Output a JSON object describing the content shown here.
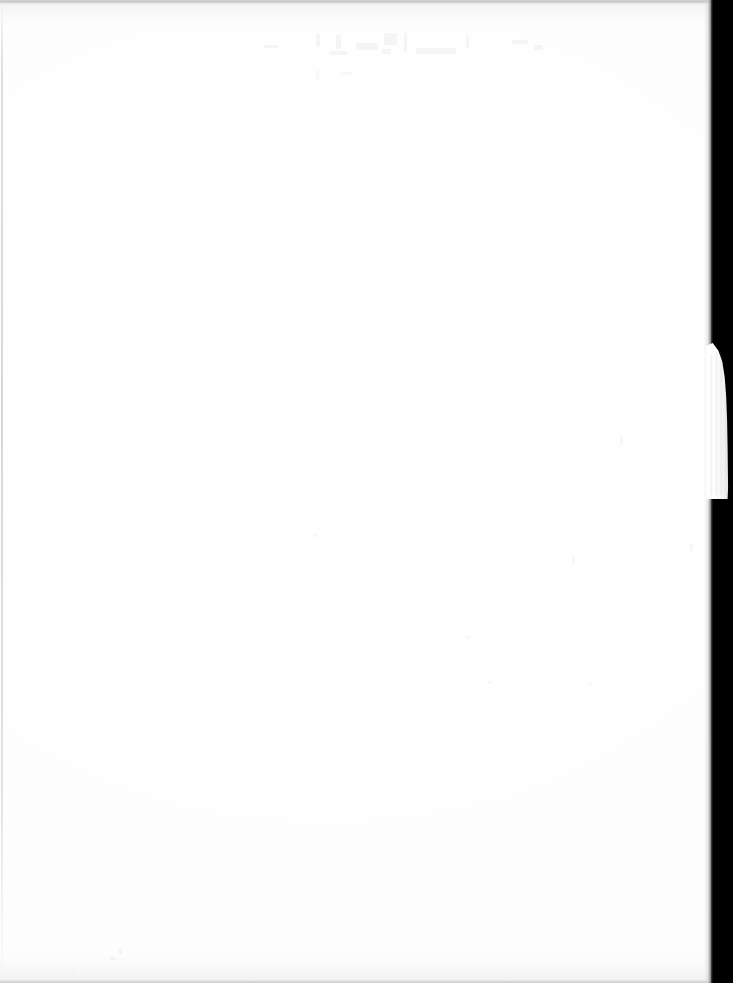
{
  "page": {
    "kind": "scanned-document-page",
    "content_text": "",
    "width_px": 733,
    "height_px": 983
  },
  "sheet": {
    "label": "blank paper sheet",
    "paper_color": "#ffffff",
    "left_px": 0,
    "top_px": 0,
    "width_px": 711,
    "height_px": 983
  },
  "scanner_margin": {
    "label": "scanner bed margin",
    "color": "#000000",
    "left_px": 711,
    "width_px": 22,
    "height_px": 983
  },
  "page_edge_sliver": {
    "label": "torn page edge protruding over scanner bed",
    "color": "#fdfdfd",
    "left_px": 706,
    "top_px": 343,
    "width_px": 24,
    "height_px": 156
  },
  "scan_artifacts": {
    "top_band_color": "#c8c8c8",
    "bottom_band_color": "#cfcfcf",
    "left_seam_color": "#d0d0d4",
    "showthrough_color": "#6a6a72",
    "speck_color": "#e9e9ec"
  }
}
